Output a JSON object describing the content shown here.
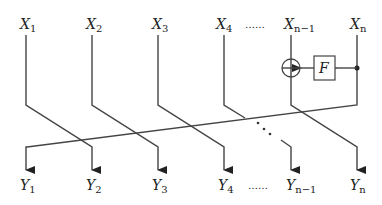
{
  "diagram": {
    "inputs": [
      {
        "var": "X",
        "sub": "1",
        "x": 26
      },
      {
        "var": "X",
        "sub": "2",
        "x": 92
      },
      {
        "var": "X",
        "sub": "3",
        "x": 158
      },
      {
        "var": "X",
        "sub": "4",
        "x": 224
      },
      {
        "var": "X",
        "sub": "n−1",
        "x": 291
      },
      {
        "var": "X",
        "sub": "n",
        "x": 357
      }
    ],
    "outputs": [
      {
        "var": "Y",
        "sub": "1",
        "x": 26
      },
      {
        "var": "Y",
        "sub": "2",
        "x": 92
      },
      {
        "var": "Y",
        "sub": "3",
        "x": 158
      },
      {
        "var": "Y",
        "sub": "4",
        "x": 224
      },
      {
        "var": "Y",
        "sub": "n−1",
        "x": 291
      },
      {
        "var": "Y",
        "sub": "n",
        "x": 357
      }
    ],
    "ellipsis_top": "……",
    "ellipsis_bottom": "……",
    "function_box_label": "F",
    "xor_symbol": "⊕"
  }
}
